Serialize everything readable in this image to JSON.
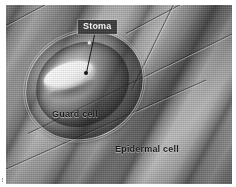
{
  "figure": {
    "kind": "scanning-electron-micrograph",
    "plate_background_color": "#8d8d8d"
  },
  "labels": {
    "stoma": {
      "text": "Stoma",
      "style": "white-text-on-dark-box",
      "text_color": "#ffffff",
      "box_color": "#3a3a3a"
    },
    "guard_cell": {
      "text": "Guard cell",
      "style": "dark-text",
      "text_color": "#141414"
    },
    "epidermal_cell": {
      "text": "Epidermal cell",
      "style": "dark-text",
      "text_color": "#141414"
    }
  },
  "annotations": {
    "stoma_leader_line": "leader-line",
    "stoma_anchor_dot": "anchor-dot"
  },
  "structures": {
    "stoma_pore": "stoma-pore",
    "guard_cell_outer": "guard-cell-outer-wall",
    "guard_cell_inner": "guard-cell-inner-wall",
    "epidermal_cells": "epidermal-cell-ridges"
  },
  "credit": {
    "text": "•••"
  }
}
